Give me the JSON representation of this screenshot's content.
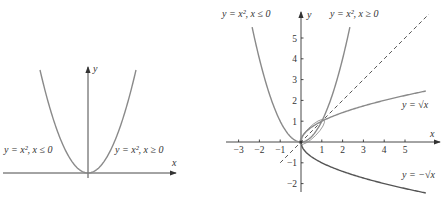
{
  "chart_data": [
    {
      "type": "line",
      "panel": "left",
      "title": "",
      "xlabel": "x",
      "ylabel": "y",
      "grid": false,
      "series": [
        {
          "name": "y = x², x ≤ 0",
          "function": "x^2",
          "domain": [
            -2.2,
            0
          ]
        },
        {
          "name": "y = x², x ≥ 0",
          "function": "x^2",
          "domain": [
            0,
            2.2
          ]
        }
      ],
      "annotations": [
        "y = x², x ≤ 0",
        "y = x², x ≥ 0"
      ]
    },
    {
      "type": "line",
      "panel": "right",
      "title": "",
      "xlabel": "x",
      "ylabel": "y",
      "xlim": [
        -3.6,
        6.3
      ],
      "ylim": [
        -2.5,
        6
      ],
      "xticks": [
        -3,
        -2,
        -1,
        1,
        2,
        3,
        4,
        5
      ],
      "yticks": [
        -2,
        -1,
        1,
        2,
        3,
        4,
        5
      ],
      "grid": false,
      "series": [
        {
          "name": "y = x², x ≤ 0",
          "function": "x^2",
          "domain": [
            -2.35,
            0
          ],
          "color": "#8a8a8a"
        },
        {
          "name": "y = x², x ≥ 0",
          "function": "x^2",
          "domain": [
            0,
            2.35
          ],
          "color": "#8a8a8a"
        },
        {
          "name": "y = √x",
          "function": "sqrt(x)",
          "domain": [
            0,
            6
          ],
          "color": "#8a8a8a"
        },
        {
          "name": "y = −√x",
          "function": "-sqrt(x)",
          "domain": [
            0,
            6
          ],
          "color": "#555555"
        },
        {
          "name": "y = x",
          "function": "x",
          "domain": [
            -1,
            6.1
          ],
          "style": "dashed",
          "color": "#444444"
        }
      ],
      "points": [
        {
          "x": 0,
          "y": 0
        },
        {
          "x": 1,
          "y": 1
        }
      ],
      "annotations": [
        "y = x², x ≤ 0",
        "y = x², x ≥ 0",
        "y = √x",
        "y = −√x"
      ]
    }
  ],
  "left": {
    "x_axis_label": "x",
    "y_axis_label": "y",
    "label_left": "y = x², x ≤ 0",
    "label_right": "y = x², x ≥ 0"
  },
  "right": {
    "x_axis_label": "x",
    "y_axis_label": "y",
    "label_top_left": "y = x², x ≤ 0",
    "label_top_right": "y = x², x ≥ 0",
    "label_sqrt": "y = √x",
    "label_neg_sqrt": "y = −√x",
    "xticks": [
      "−3",
      "−2",
      "−1",
      "1",
      "2",
      "3",
      "4",
      "5"
    ],
    "yticks": [
      "5",
      "4",
      "3",
      "2",
      "1",
      "−1",
      "−2"
    ]
  },
  "colors": {
    "curve": "#8a8a8a",
    "curve_dark": "#555555",
    "axis": "#333333"
  }
}
